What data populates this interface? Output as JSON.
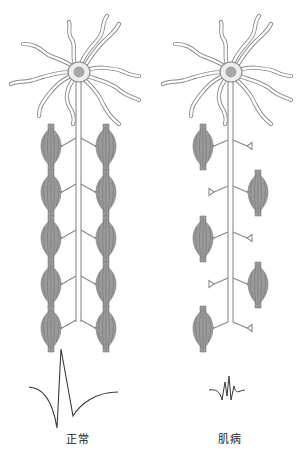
{
  "figure": {
    "panels": [
      {
        "id": "normal",
        "label": "正常",
        "axon_x": 78,
        "soma": {
          "cx": 79,
          "cy": 72
        },
        "levels": [
          {
            "y": 140,
            "left_muscle": true,
            "right_muscle": true
          },
          {
            "y": 186,
            "left_muscle": true,
            "right_muscle": true
          },
          {
            "y": 232,
            "left_muscle": true,
            "right_muscle": true
          },
          {
            "y": 278,
            "left_muscle": true,
            "right_muscle": true
          },
          {
            "y": 322,
            "left_muscle": true,
            "right_muscle": true
          }
        ],
        "waveform": "large-biphasic-motor-unit-potential"
      },
      {
        "id": "myopathy",
        "label": "肌病",
        "axon_x": 230,
        "soma": {
          "cx": 231,
          "cy": 72
        },
        "levels": [
          {
            "y": 140,
            "left_muscle": true,
            "right_muscle": false
          },
          {
            "y": 186,
            "left_muscle": false,
            "right_muscle": true
          },
          {
            "y": 232,
            "left_muscle": true,
            "right_muscle": false
          },
          {
            "y": 278,
            "left_muscle": false,
            "right_muscle": true
          },
          {
            "y": 322,
            "left_muscle": true,
            "right_muscle": false
          }
        ],
        "waveform": "small-polyphasic-motor-unit-potential"
      }
    ],
    "colors": {
      "outline": "#8a8a8a",
      "soma_fill": "#ededed",
      "nucleus": "#a8a8a8",
      "muscle": "#8c8c8c",
      "waveform": "#3a3a3a",
      "text": "#222222"
    }
  }
}
